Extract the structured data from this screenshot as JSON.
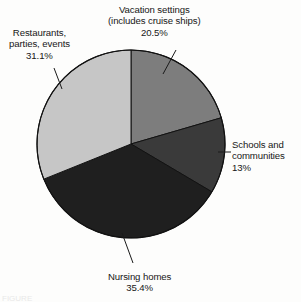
{
  "figure": {
    "background_color": "#fdfdfc",
    "caption_fragment": "FIGURE"
  },
  "chart_data": {
    "type": "pie",
    "title": "",
    "xlabel": "",
    "ylabel": "",
    "legend_position": "none",
    "grid": false,
    "labels_outside": true,
    "start_angle_deg": 0,
    "direction": "clockwise",
    "center": {
      "x": 131,
      "y": 144,
      "r": 94
    },
    "categories": [
      "Vacation settings (includes cruise ships)",
      "Schools and communities",
      "Nursing homes",
      "Restaurants, parties, events"
    ],
    "values": [
      20.5,
      13,
      35.4,
      31.1
    ],
    "value_labels": [
      "20.5%",
      "13%",
      "35.4%",
      "31.1%"
    ],
    "colors": [
      "#7d7d7d",
      "#3a3a3a",
      "#1f1f1f",
      "#c6c6c6"
    ],
    "slices": [
      {
        "name": "vacation-settings",
        "value": 20.5,
        "value_label": "20.5%",
        "color": "#7d7d7d",
        "start_deg": 0,
        "end_deg": 73.8,
        "label_lines": [
          "Vacation settings",
          "(includes cruise ships)",
          "20.5%"
        ]
      },
      {
        "name": "schools-and-communities",
        "value": 13,
        "value_label": "13%",
        "color": "#3a3a3a",
        "start_deg": 73.8,
        "end_deg": 120.6,
        "label_lines": [
          "Schools and",
          "communities",
          "13%"
        ]
      },
      {
        "name": "nursing-homes",
        "value": 35.4,
        "value_label": "35.4%",
        "color": "#1f1f1f",
        "start_deg": 120.6,
        "end_deg": 248.04,
        "label_lines": [
          "Nursing homes",
          "35.4%"
        ]
      },
      {
        "name": "restaurants-parties-events",
        "value": 31.1,
        "value_label": "31.1%",
        "color": "#c6c6c6",
        "start_deg": 248.04,
        "end_deg": 360,
        "label_lines": [
          "Restaurants,",
          "parties, events",
          "31.1%"
        ]
      }
    ]
  },
  "labels": {
    "vacation": {
      "line1": "Vacation settings",
      "line2": "(includes cruise ships)",
      "line3": "20.5%"
    },
    "restaurants": {
      "line1": "Restaurants,",
      "line2": "parties, events",
      "line3": "31.1%"
    },
    "schools": {
      "line1": "Schools and",
      "line2": "communities",
      "line3": "13%"
    },
    "nursing": {
      "line1": "Nursing homes",
      "line2": "35.4%"
    }
  }
}
